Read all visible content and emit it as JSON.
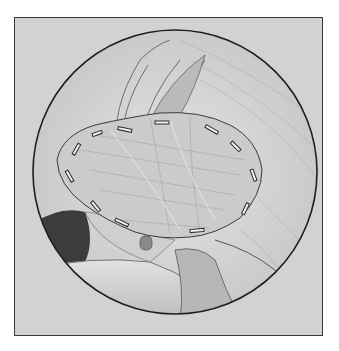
{
  "illustration": {
    "subject": "surgical patch graft sutured over shoulder rotator cuff (arthroscopic circular view)",
    "style": "pencil graphite drawing",
    "colors": {
      "background": "#ffffff",
      "frame_fill": "#d2d2d2",
      "frame_border": "#3a3a3a",
      "circle_line": "#1e1e1e",
      "patch_fill": "#c9c9c9",
      "dark_shadow": "#3c3c3c"
    },
    "suture_count": 16
  }
}
